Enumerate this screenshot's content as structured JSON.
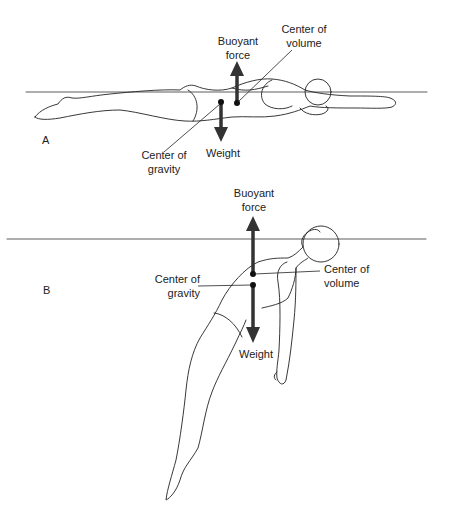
{
  "figure": {
    "panels": [
      {
        "id": "A",
        "letter": "A",
        "description": "Swimmer floating horizontally, prone, arms extended forward",
        "labels": {
          "buoyant_line1": "Buoyant",
          "buoyant_line2": "force",
          "volume_line1": "Center of",
          "volume_line2": "volume",
          "gravity_line1": "Center of",
          "gravity_line2": "gravity",
          "weight": "Weight"
        }
      },
      {
        "id": "B",
        "letter": "B",
        "description": "Swimmer floating vertically-inclined, supine, legs sinking",
        "labels": {
          "buoyant_line1": "Buoyant",
          "buoyant_line2": "force",
          "volume_line1": "Center of",
          "volume_line2": "volume",
          "gravity_line1": "Center of",
          "gravity_line2": "gravity",
          "weight": "Weight"
        }
      }
    ],
    "colors": {
      "line": "#222222",
      "arrow": "#333333",
      "background": "#ffffff"
    }
  }
}
